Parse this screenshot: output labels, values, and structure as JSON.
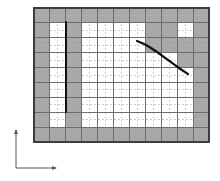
{
  "figure": {
    "background_color": "#ffffff",
    "canvas": {
      "width": 220,
      "height": 181
    }
  },
  "colors": {
    "shaded_cell": "#a8a8a8",
    "shaded_cell_edge": "#9b9b9b",
    "coarse_grid": "#6e6e6e",
    "fine_grid_dashed": "#b4b4b4",
    "domain_border": "#3c3c3c",
    "curve_stroke": "#111111",
    "segment_stroke": "#111111",
    "axis_stroke": "#555555",
    "cell_white": "#ffffff"
  },
  "grid": {
    "label": "computational-grid",
    "x0": 34,
    "y0": 8,
    "x1": 209,
    "y1": 142,
    "columns": 11,
    "rows": 9,
    "cell_width": 15.909,
    "cell_height": 14.889,
    "border_width": 2,
    "coarse_line_width": 1,
    "fine_subdivisions": 2,
    "fine_dash_pattern": "2,2",
    "fine_line_width": 0.7
  },
  "shaded_cells": {
    "label": "boundary-cells",
    "description": "Grid cells marked as boundary/solid, given as [column,row] zero-indexed from top-left of the grid",
    "boundary_ring": {
      "top_row": [
        0,
        1,
        2,
        3,
        4,
        5,
        6,
        7,
        8,
        9,
        10
      ],
      "bottom_row": [
        0,
        1,
        2,
        3,
        4,
        5,
        6,
        7,
        8,
        9,
        10
      ],
      "left_column": [
        0,
        1,
        2,
        3,
        4,
        5,
        6,
        7,
        8
      ],
      "right_column": [
        0,
        1,
        2,
        3,
        4,
        5,
        6,
        7,
        8
      ]
    },
    "segment_column_cells": [
      [
        2,
        1
      ],
      [
        2,
        2
      ],
      [
        2,
        3
      ],
      [
        2,
        4
      ],
      [
        2,
        5
      ],
      [
        2,
        6
      ],
      [
        2,
        7
      ]
    ],
    "staircase_cells": [
      [
        7,
        1
      ],
      [
        8,
        1
      ],
      [
        7,
        2
      ],
      [
        8,
        2
      ],
      [
        9,
        2
      ],
      [
        9,
        3
      ],
      [
        10,
        3
      ]
    ]
  },
  "features": {
    "vertical_segment": {
      "label": "thin-plate-segment",
      "x": 66,
      "y_top": 22,
      "y_bottom": 112,
      "stroke_width": 2.0
    },
    "curve": {
      "label": "curved-boundary",
      "stroke_width": 2.2,
      "path_points": [
        {
          "x": 137,
          "y": 41
        },
        {
          "x": 146,
          "y": 45
        },
        {
          "x": 157,
          "y": 52
        },
        {
          "x": 168,
          "y": 60
        },
        {
          "x": 179,
          "y": 68
        },
        {
          "x": 188,
          "y": 74
        }
      ]
    }
  },
  "axes": {
    "label": "coordinate-axes",
    "origin": {
      "x": 16,
      "y": 168
    },
    "vertical": {
      "label": "y-axis",
      "from_y": 168,
      "to_y": 130,
      "arrow": "up"
    },
    "horizontal": {
      "label": "x-axis",
      "from_x": 16,
      "to_x": 56,
      "arrow": "right"
    },
    "stroke_width": 1.0,
    "arrow_size": 4
  }
}
